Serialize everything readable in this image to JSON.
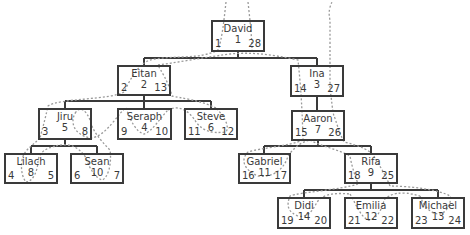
{
  "diagram": {
    "type": "tree-traversal",
    "colors": {
      "box_border": "#3a3a3a",
      "edge": "#3a3a3a",
      "traversal_path": "#999999"
    },
    "nodes": [
      {
        "key": "david",
        "name": "David",
        "id": "1",
        "left": "1",
        "right": "28",
        "x": 211,
        "y": 20,
        "w": 54,
        "h": 32
      },
      {
        "key": "eitan",
        "name": "Eitan",
        "id": "2",
        "left": "2",
        "right": "13",
        "x": 117,
        "y": 65,
        "w": 54,
        "h": 31
      },
      {
        "key": "ina",
        "name": "Ina",
        "id": "3",
        "left": "14",
        "right": "27",
        "x": 290,
        "y": 65,
        "w": 54,
        "h": 32
      },
      {
        "key": "jiru",
        "name": "Jiru",
        "id": "5",
        "left": "3",
        "right": "8",
        "x": 38,
        "y": 108,
        "w": 54,
        "h": 32
      },
      {
        "key": "seraph",
        "name": "Seraph",
        "id": "4",
        "left": "9",
        "right": "10",
        "x": 117,
        "y": 108,
        "w": 55,
        "h": 32
      },
      {
        "key": "steve",
        "name": "Steve",
        "id": "6",
        "left": "11",
        "right": "12",
        "x": 184,
        "y": 108,
        "w": 54,
        "h": 32
      },
      {
        "key": "aaron",
        "name": "Aaron",
        "id": "7",
        "left": "15",
        "right": "26",
        "x": 291,
        "y": 110,
        "w": 54,
        "h": 31
      },
      {
        "key": "lilach",
        "name": "Lilach",
        "id": "8",
        "left": "4",
        "right": "5",
        "x": 4,
        "y": 153,
        "w": 54,
        "h": 31
      },
      {
        "key": "sean",
        "name": "Sean",
        "id": "10",
        "left": "6",
        "right": "7",
        "x": 70,
        "y": 153,
        "w": 54,
        "h": 31
      },
      {
        "key": "gabriel",
        "name": "Gabriel",
        "id": "11",
        "left": "16",
        "right": "17",
        "x": 238,
        "y": 153,
        "w": 53,
        "h": 31
      },
      {
        "key": "rifa",
        "name": "Rifa",
        "id": "9",
        "left": "18",
        "right": "25",
        "x": 344,
        "y": 153,
        "w": 54,
        "h": 31
      },
      {
        "key": "didi",
        "name": "Didi",
        "id": "14",
        "left": "19",
        "right": "20",
        "x": 277,
        "y": 197,
        "w": 54,
        "h": 32
      },
      {
        "key": "emilia",
        "name": "Emilia",
        "id": "12",
        "left": "21",
        "right": "22",
        "x": 344,
        "y": 197,
        "w": 54,
        "h": 32
      },
      {
        "key": "michael",
        "name": "Michael",
        "id": "13",
        "left": "23",
        "right": "24",
        "x": 411,
        "y": 197,
        "w": 54,
        "h": 32
      }
    ],
    "edges": [
      [
        "David",
        "Eitan"
      ],
      [
        "David",
        "Ina"
      ],
      [
        "Eitan",
        "Jiru"
      ],
      [
        "Eitan",
        "Seraph"
      ],
      [
        "Eitan",
        "Steve"
      ],
      [
        "Jiru",
        "Lilach"
      ],
      [
        "Jiru",
        "Sean"
      ],
      [
        "Ina",
        "Aaron"
      ],
      [
        "Aaron",
        "Gabriel"
      ],
      [
        "Aaron",
        "Rifa"
      ],
      [
        "Rifa",
        "Didi"
      ],
      [
        "Rifa",
        "Emilia"
      ],
      [
        "Rifa",
        "Michael"
      ]
    ]
  }
}
